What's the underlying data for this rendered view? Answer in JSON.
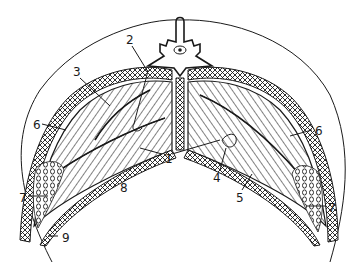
{
  "figure": {
    "type": "anatomical cross-section line drawing",
    "background": "#ffffff",
    "ink": "#1a1a1a"
  },
  "labels": [
    {
      "id": "1",
      "text": "1",
      "x": 167,
      "y": 158
    },
    {
      "id": "2",
      "text": "2",
      "x": 128,
      "y": 42
    },
    {
      "id": "3",
      "text": "3",
      "x": 74,
      "y": 74
    },
    {
      "id": "4",
      "text": "4",
      "x": 216,
      "y": 180
    },
    {
      "id": "5",
      "text": "5",
      "x": 238,
      "y": 200
    },
    {
      "id": "6L",
      "text": "6",
      "x": 35,
      "y": 127
    },
    {
      "id": "6R",
      "text": "6",
      "x": 318,
      "y": 133
    },
    {
      "id": "7L",
      "text": "7",
      "x": 21,
      "y": 200
    },
    {
      "id": "7R",
      "text": "7",
      "x": 330,
      "y": 210
    },
    {
      "id": "8",
      "text": "8",
      "x": 122,
      "y": 190
    },
    {
      "id": "9",
      "text": "9",
      "x": 64,
      "y": 240
    }
  ]
}
